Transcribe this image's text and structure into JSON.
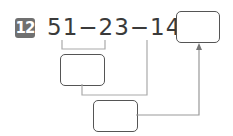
{
  "problem": {
    "number": "12",
    "expression": "51−23−14=",
    "terms": [
      "51",
      "23",
      "14"
    ],
    "operators": [
      "−",
      "−",
      "="
    ]
  },
  "boxes": {
    "answer": "",
    "step1": "",
    "step2": ""
  },
  "colors": {
    "badge": "#707070",
    "text": "#3a3a3a",
    "lines": "#aaaaaa"
  }
}
